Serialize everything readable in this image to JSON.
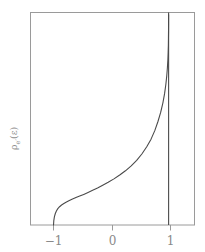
{
  "figure": {
    "background_color": "#ffffff",
    "frame_color": "#9a9a9a",
    "curve_color": "#4a4a4a",
    "tick_color": "#9a9a9a",
    "label_color": "#8a8a8a"
  },
  "chart_data": {
    "type": "line",
    "title": "",
    "subtitle": "",
    "xlabel": "",
    "ylabel": "ρ",
    "ylabel_sub": "e′",
    "ylabel_arg": "(ε)",
    "ylabel_full": "ρ_{e′}(ε)",
    "xlim": [
      -1.4,
      1.45
    ],
    "ylim": [
      0,
      1.0
    ],
    "grid": false,
    "legend": null,
    "xticks": [
      -1,
      0,
      1
    ],
    "xtick_labels": [
      "−1",
      "0",
      "1"
    ],
    "yticks": [],
    "ytick_labels": [],
    "annotations": [
      {
        "name": "vertical-asymptote",
        "type": "vline",
        "x": 1.0,
        "label": ""
      }
    ],
    "series": [
      {
        "name": "density-of-states",
        "color": "#4a4a4a",
        "linewidth": 1.1,
        "x": [
          -1.0,
          -0.995,
          -0.985,
          -0.97,
          -0.95,
          -0.925,
          -0.895,
          -0.86,
          -0.82,
          -0.775,
          -0.725,
          -0.67,
          -0.61,
          -0.545,
          -0.475,
          -0.4,
          -0.32,
          -0.235,
          -0.145,
          -0.05,
          0.05,
          0.15,
          0.25,
          0.35,
          0.445,
          0.535,
          0.62,
          0.695,
          0.76,
          0.815,
          0.862,
          0.9,
          0.93,
          0.952,
          0.968,
          0.979,
          0.987,
          0.992,
          0.9955,
          0.9975,
          0.9988,
          0.9995,
          0.9999
        ],
        "y": [
          0.0,
          0.021,
          0.038,
          0.053,
          0.066,
          0.077,
          0.086,
          0.094,
          0.101,
          0.108,
          0.115,
          0.122,
          0.129,
          0.136,
          0.144,
          0.153,
          0.163,
          0.174,
          0.187,
          0.201,
          0.217,
          0.235,
          0.255,
          0.278,
          0.304,
          0.334,
          0.368,
          0.404,
          0.444,
          0.487,
          0.53,
          0.574,
          0.618,
          0.661,
          0.702,
          0.74,
          0.776,
          0.81,
          0.845,
          0.88,
          0.915,
          0.95,
          0.99
        ]
      }
    ]
  }
}
